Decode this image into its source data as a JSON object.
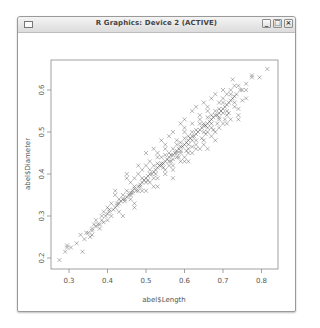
{
  "window": {
    "title": "R Graphics: Device 2 (ACTIVE)",
    "buttons": {
      "minimize": "_",
      "maximize": "□",
      "close": "×"
    }
  },
  "chart_data": {
    "type": "scatter",
    "title": "",
    "xlabel": "abel$Length",
    "ylabel": "abel$Diameter",
    "xticks": [
      0.3,
      0.4,
      0.5,
      0.6,
      0.7,
      0.8
    ],
    "xtick_labels": [
      "0.3",
      "0.4",
      "0.5",
      "0.6",
      "0.7",
      "0.8"
    ],
    "yticks": [
      0.2,
      0.3,
      0.4,
      0.5,
      0.6
    ],
    "ytick_labels": [
      "0.2",
      "0.3",
      "0.4",
      "0.5",
      "0.6"
    ],
    "xlim": [
      0.253,
      0.843
    ],
    "ylim": [
      0.174,
      0.671
    ],
    "marker": "x",
    "grid": false,
    "legend": null,
    "points": [
      [
        0.275,
        0.195
      ],
      [
        0.29,
        0.215
      ],
      [
        0.295,
        0.225
      ],
      [
        0.305,
        0.225
      ],
      [
        0.295,
        0.23
      ],
      [
        0.335,
        0.215
      ],
      [
        0.33,
        0.255
      ],
      [
        0.345,
        0.26
      ],
      [
        0.35,
        0.26
      ],
      [
        0.36,
        0.265
      ],
      [
        0.37,
        0.275
      ],
      [
        0.375,
        0.28
      ],
      [
        0.385,
        0.29
      ],
      [
        0.39,
        0.285
      ],
      [
        0.395,
        0.3
      ],
      [
        0.4,
        0.305
      ],
      [
        0.405,
        0.31
      ],
      [
        0.41,
        0.3
      ],
      [
        0.415,
        0.315
      ],
      [
        0.42,
        0.32
      ],
      [
        0.425,
        0.325
      ],
      [
        0.43,
        0.33
      ],
      [
        0.435,
        0.335
      ],
      [
        0.44,
        0.34
      ],
      [
        0.445,
        0.335
      ],
      [
        0.45,
        0.345
      ],
      [
        0.455,
        0.35
      ],
      [
        0.46,
        0.355
      ],
      [
        0.465,
        0.36
      ],
      [
        0.47,
        0.365
      ],
      [
        0.475,
        0.36
      ],
      [
        0.48,
        0.37
      ],
      [
        0.485,
        0.375
      ],
      [
        0.49,
        0.38
      ],
      [
        0.495,
        0.385
      ],
      [
        0.5,
        0.39
      ],
      [
        0.505,
        0.395
      ],
      [
        0.51,
        0.4
      ],
      [
        0.515,
        0.4
      ],
      [
        0.52,
        0.405
      ],
      [
        0.525,
        0.41
      ],
      [
        0.53,
        0.415
      ],
      [
        0.535,
        0.42
      ],
      [
        0.54,
        0.425
      ],
      [
        0.545,
        0.425
      ],
      [
        0.55,
        0.43
      ],
      [
        0.555,
        0.435
      ],
      [
        0.56,
        0.44
      ],
      [
        0.565,
        0.445
      ],
      [
        0.57,
        0.445
      ],
      [
        0.575,
        0.45
      ],
      [
        0.58,
        0.455
      ],
      [
        0.585,
        0.46
      ],
      [
        0.59,
        0.465
      ],
      [
        0.595,
        0.465
      ],
      [
        0.6,
        0.47
      ],
      [
        0.605,
        0.475
      ],
      [
        0.61,
        0.48
      ],
      [
        0.615,
        0.485
      ],
      [
        0.62,
        0.49
      ],
      [
        0.625,
        0.49
      ],
      [
        0.63,
        0.495
      ],
      [
        0.635,
        0.5
      ],
      [
        0.64,
        0.505
      ],
      [
        0.645,
        0.51
      ],
      [
        0.65,
        0.515
      ],
      [
        0.655,
        0.515
      ],
      [
        0.66,
        0.52
      ],
      [
        0.665,
        0.525
      ],
      [
        0.67,
        0.53
      ],
      [
        0.675,
        0.535
      ],
      [
        0.68,
        0.54
      ],
      [
        0.685,
        0.54
      ],
      [
        0.69,
        0.545
      ],
      [
        0.695,
        0.55
      ],
      [
        0.7,
        0.555
      ],
      [
        0.705,
        0.56
      ],
      [
        0.71,
        0.565
      ],
      [
        0.715,
        0.57
      ],
      [
        0.72,
        0.575
      ],
      [
        0.725,
        0.58
      ],
      [
        0.73,
        0.585
      ],
      [
        0.735,
        0.59
      ],
      [
        0.745,
        0.6
      ],
      [
        0.76,
        0.615
      ],
      [
        0.775,
        0.635
      ],
      [
        0.815,
        0.65
      ],
      [
        0.795,
        0.63
      ],
      [
        0.775,
        0.63
      ],
      [
        0.725,
        0.625
      ],
      [
        0.44,
        0.3
      ],
      [
        0.47,
        0.33
      ],
      [
        0.5,
        0.36
      ],
      [
        0.52,
        0.37
      ],
      [
        0.55,
        0.4
      ],
      [
        0.57,
        0.41
      ],
      [
        0.6,
        0.43
      ],
      [
        0.62,
        0.45
      ],
      [
        0.65,
        0.47
      ],
      [
        0.68,
        0.5
      ],
      [
        0.7,
        0.52
      ],
      [
        0.72,
        0.53
      ],
      [
        0.74,
        0.54
      ],
      [
        0.46,
        0.38
      ],
      [
        0.48,
        0.4
      ],
      [
        0.5,
        0.42
      ],
      [
        0.53,
        0.44
      ],
      [
        0.55,
        0.46
      ],
      [
        0.58,
        0.48
      ],
      [
        0.6,
        0.5
      ],
      [
        0.62,
        0.52
      ],
      [
        0.64,
        0.54
      ],
      [
        0.66,
        0.55
      ],
      [
        0.69,
        0.57
      ],
      [
        0.71,
        0.59
      ],
      [
        0.42,
        0.36
      ],
      [
        0.45,
        0.39
      ],
      [
        0.48,
        0.42
      ],
      [
        0.5,
        0.45
      ],
      [
        0.54,
        0.48
      ],
      [
        0.57,
        0.5
      ],
      [
        0.59,
        0.52
      ],
      [
        0.62,
        0.55
      ],
      [
        0.65,
        0.57
      ],
      [
        0.68,
        0.59
      ],
      [
        0.7,
        0.6
      ],
      [
        0.73,
        0.61
      ],
      [
        0.76,
        0.58
      ],
      [
        0.74,
        0.555
      ],
      [
        0.68,
        0.48
      ],
      [
        0.64,
        0.46
      ],
      [
        0.6,
        0.44
      ],
      [
        0.56,
        0.42
      ],
      [
        0.52,
        0.39
      ],
      [
        0.49,
        0.36
      ],
      [
        0.46,
        0.34
      ],
      [
        0.43,
        0.31
      ],
      [
        0.4,
        0.29
      ],
      [
        0.38,
        0.27
      ],
      [
        0.36,
        0.255
      ],
      [
        0.34,
        0.245
      ],
      [
        0.32,
        0.235
      ],
      [
        0.58,
        0.44
      ],
      [
        0.59,
        0.45
      ],
      [
        0.61,
        0.46
      ],
      [
        0.63,
        0.47
      ],
      [
        0.66,
        0.5
      ],
      [
        0.67,
        0.51
      ],
      [
        0.69,
        0.53
      ],
      [
        0.71,
        0.54
      ],
      [
        0.73,
        0.56
      ],
      [
        0.75,
        0.575
      ],
      [
        0.56,
        0.43
      ],
      [
        0.57,
        0.435
      ],
      [
        0.59,
        0.455
      ],
      [
        0.61,
        0.47
      ],
      [
        0.63,
        0.48
      ],
      [
        0.65,
        0.5
      ],
      [
        0.67,
        0.52
      ],
      [
        0.69,
        0.535
      ],
      [
        0.71,
        0.55
      ],
      [
        0.52,
        0.42
      ],
      [
        0.54,
        0.44
      ],
      [
        0.56,
        0.45
      ],
      [
        0.58,
        0.47
      ],
      [
        0.6,
        0.485
      ],
      [
        0.62,
        0.5
      ],
      [
        0.64,
        0.52
      ],
      [
        0.66,
        0.535
      ],
      [
        0.68,
        0.55
      ],
      [
        0.7,
        0.57
      ],
      [
        0.72,
        0.59
      ],
      [
        0.51,
        0.38
      ],
      [
        0.53,
        0.39
      ],
      [
        0.55,
        0.41
      ],
      [
        0.57,
        0.42
      ],
      [
        0.59,
        0.43
      ],
      [
        0.61,
        0.45
      ],
      [
        0.63,
        0.46
      ],
      [
        0.65,
        0.48
      ],
      [
        0.67,
        0.49
      ],
      [
        0.69,
        0.51
      ],
      [
        0.71,
        0.52
      ],
      [
        0.47,
        0.37
      ],
      [
        0.49,
        0.39
      ],
      [
        0.51,
        0.41
      ],
      [
        0.53,
        0.425
      ],
      [
        0.55,
        0.445
      ],
      [
        0.57,
        0.46
      ],
      [
        0.59,
        0.475
      ],
      [
        0.61,
        0.49
      ],
      [
        0.63,
        0.505
      ],
      [
        0.65,
        0.52
      ],
      [
        0.67,
        0.54
      ],
      [
        0.69,
        0.555
      ],
      [
        0.44,
        0.35
      ],
      [
        0.45,
        0.36
      ],
      [
        0.41,
        0.33
      ],
      [
        0.43,
        0.34
      ],
      [
        0.39,
        0.31
      ],
      [
        0.37,
        0.29
      ],
      [
        0.38,
        0.28
      ],
      [
        0.36,
        0.27
      ],
      [
        0.355,
        0.25
      ],
      [
        0.4,
        0.32
      ],
      [
        0.42,
        0.35
      ],
      [
        0.47,
        0.39
      ],
      [
        0.49,
        0.41
      ],
      [
        0.51,
        0.43
      ],
      [
        0.53,
        0.45
      ],
      [
        0.55,
        0.47
      ],
      [
        0.6,
        0.51
      ],
      [
        0.64,
        0.53
      ],
      [
        0.66,
        0.56
      ],
      [
        0.7,
        0.58
      ],
      [
        0.72,
        0.6
      ],
      [
        0.74,
        0.61
      ],
      [
        0.75,
        0.6
      ],
      [
        0.73,
        0.57
      ],
      [
        0.7,
        0.545
      ],
      [
        0.66,
        0.51
      ],
      [
        0.62,
        0.48
      ],
      [
        0.58,
        0.45
      ],
      [
        0.54,
        0.42
      ],
      [
        0.5,
        0.38
      ],
      [
        0.48,
        0.36
      ],
      [
        0.46,
        0.35
      ],
      [
        0.61,
        0.43
      ],
      [
        0.66,
        0.46
      ],
      [
        0.74,
        0.53
      ],
      [
        0.47,
        0.32
      ],
      [
        0.53,
        0.37
      ],
      [
        0.57,
        0.39
      ],
      [
        0.45,
        0.4
      ],
      [
        0.52,
        0.46
      ],
      [
        0.56,
        0.49
      ],
      [
        0.6,
        0.53
      ],
      [
        0.63,
        0.56
      ],
      [
        0.67,
        0.58
      ],
      [
        0.76,
        0.6
      ],
      [
        0.62,
        0.465
      ],
      [
        0.645,
        0.485
      ],
      [
        0.655,
        0.495
      ],
      [
        0.675,
        0.505
      ],
      [
        0.685,
        0.52
      ],
      [
        0.705,
        0.53
      ],
      [
        0.715,
        0.545
      ],
      [
        0.605,
        0.455
      ],
      [
        0.585,
        0.44
      ],
      [
        0.565,
        0.43
      ],
      [
        0.545,
        0.415
      ],
      [
        0.525,
        0.4
      ],
      [
        0.505,
        0.385
      ],
      [
        0.485,
        0.37
      ],
      [
        0.465,
        0.355
      ],
      [
        0.445,
        0.34
      ],
      [
        0.425,
        0.33
      ],
      [
        0.405,
        0.315
      ],
      [
        0.385,
        0.3
      ],
      [
        0.365,
        0.28
      ]
    ]
  }
}
